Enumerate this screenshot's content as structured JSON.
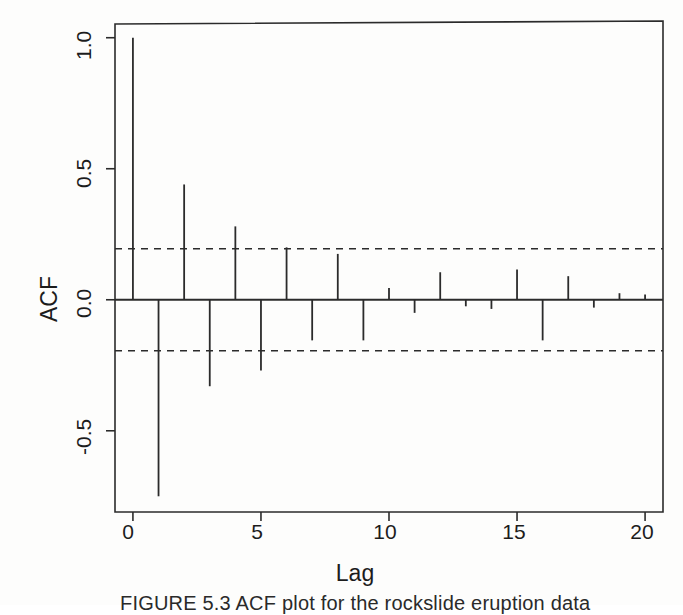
{
  "figure": {
    "axis_title_y": "ACF",
    "axis_title_x": "Lag",
    "caption": "FIGURE 5.3   ACF plot for the rockslide eruption data"
  },
  "chart_data": {
    "type": "bar",
    "title": "",
    "subtitle": "",
    "xlabel": "Lag",
    "ylabel": "ACF",
    "grid": false,
    "legend": "none",
    "xlim": [
      -0.7,
      20.7
    ],
    "ylim": [
      -0.81,
      1.06
    ],
    "xticks": [
      0,
      5,
      10,
      15,
      20
    ],
    "xtick_labels": [
      "0",
      "5",
      "10",
      "15",
      "20"
    ],
    "yticks": [
      1.0,
      0.5,
      0.0,
      -0.5
    ],
    "ytick_labels": [
      "1.0",
      "0.5",
      "0.0",
      "-0.5"
    ],
    "baseline": 0.0,
    "confidence_bounds": [
      0.195,
      -0.195
    ],
    "confidence_style": "dashed",
    "categories": [
      0,
      1,
      2,
      3,
      4,
      5,
      6,
      7,
      8,
      9,
      10,
      11,
      12,
      13,
      14,
      15,
      16,
      17,
      18,
      19,
      20
    ],
    "values": [
      1.0,
      -0.75,
      0.44,
      -0.33,
      0.28,
      -0.27,
      0.2,
      -0.155,
      0.175,
      -0.155,
      0.045,
      -0.05,
      0.105,
      -0.025,
      -0.035,
      0.115,
      -0.155,
      0.09,
      -0.03,
      0.025,
      0.02
    ],
    "annotations": []
  }
}
